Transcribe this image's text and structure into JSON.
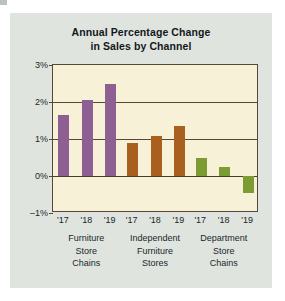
{
  "chart_data": {
    "type": "bar",
    "title": "Annual Percentage Change in Sales by Channel",
    "title_line1": "Annual Percentage Change",
    "title_line2": "in Sales by Channel",
    "xlabel": "",
    "ylabel": "",
    "ylim": [
      -1,
      3
    ],
    "yticks": [
      3,
      2,
      1,
      0,
      -1
    ],
    "ytick_labels": [
      "3%",
      "2%",
      "1%",
      "0%",
      "–1%"
    ],
    "grid": true,
    "legend": "none",
    "x": [
      "'17",
      "'18",
      "'19",
      "'17",
      "'18",
      "'19",
      "'17",
      "'18",
      "'19"
    ],
    "categories": [
      "Furniture Store Chains",
      "Independent Furniture Stores",
      "Department Store Chains"
    ],
    "groups": [
      {
        "name": "Furniture Store Chains",
        "label_lines": [
          "Furniture",
          "Store",
          "Chains"
        ],
        "color": "#8d5f92",
        "years": [
          "'17",
          "'18",
          "'19"
        ],
        "values": [
          1.65,
          2.05,
          2.5
        ]
      },
      {
        "name": "Independent Furniture Stores",
        "label_lines": [
          "Independent",
          "Furniture",
          "Stores"
        ],
        "color": "#a9601f",
        "years": [
          "'17",
          "'18",
          "'19"
        ],
        "values": [
          0.9,
          1.08,
          1.35
        ]
      },
      {
        "name": "Department Store Chains",
        "label_lines": [
          "Department",
          "Store",
          "Chains"
        ],
        "color": "#7d9b33",
        "years": [
          "'17",
          "'18",
          "'19"
        ],
        "values": [
          0.5,
          0.25,
          -0.45
        ]
      }
    ],
    "colors": {
      "furniture_store_chains": "#8d5f92",
      "independent_furniture_stores": "#a9601f",
      "department_store_chains": "#7d9b33",
      "plot_background": "#f7f1d8",
      "panel_background": "#dfe5de",
      "axis": "#58463a"
    }
  }
}
